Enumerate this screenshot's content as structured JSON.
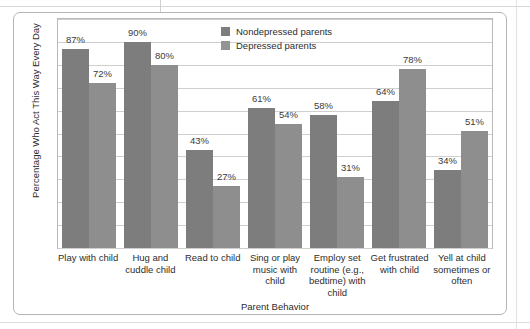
{
  "chart_data": {
    "type": "bar",
    "title": "",
    "xlabel": "Parent Behavior",
    "ylabel": "Percentage Who Act This Way Every Day",
    "ylim": [
      0,
      100
    ],
    "grid": true,
    "gridline_count": 10,
    "legend_position": "top-center",
    "categories": [
      "Play with child",
      "Hug and cuddle child",
      "Read to child",
      "Sing or play music with child",
      "Employ set routine (e.g., bedtime) with child",
      "Get frustrated with child",
      "Yell at child sometimes or often"
    ],
    "series": [
      {
        "name": "Nondepressed parents",
        "color": "#7d7d7d",
        "values": [
          87,
          90,
          43,
          61,
          58,
          64,
          34
        ],
        "value_labels": [
          "87%",
          "90%",
          "43%",
          "61%",
          "58%",
          "64%",
          "34%"
        ]
      },
      {
        "name": "Depressed parents",
        "color": "#8e8e8e",
        "values": [
          72,
          80,
          27,
          54,
          31,
          78,
          51
        ],
        "value_labels": [
          "72%",
          "80%",
          "27%",
          "54%",
          "31%",
          "78%",
          "51%"
        ]
      }
    ]
  },
  "legend": {
    "entries": [
      {
        "label": "Nondepressed parents",
        "swatch": "legend-swatch-nondepressed"
      },
      {
        "label": "Depressed parents",
        "swatch": "legend-swatch-depressed"
      }
    ]
  },
  "axes": {
    "y_title": "Percentage Who Act This Way Every Day",
    "x_title": "Parent Behavior"
  },
  "x_tick_labels": [
    "Play with child",
    "Hug and cuddle child",
    "Read to child",
    "Sing or play music with child",
    "Employ set routine (e.g., bedtime) with child",
    "Get frustrated with child",
    "Yell at child sometimes or often"
  ]
}
